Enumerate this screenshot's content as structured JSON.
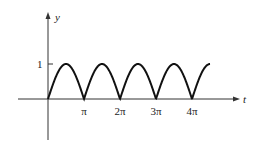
{
  "chart_data": {
    "type": "line",
    "title": "",
    "function": "y = |sin t|",
    "xlabel": "t",
    "ylabel": "y",
    "x_ticks": [
      {
        "value": 3.14159,
        "label": "π"
      },
      {
        "value": 6.28319,
        "label": "2π"
      },
      {
        "value": 9.42478,
        "label": "3π"
      },
      {
        "value": 12.56637,
        "label": "4π"
      }
    ],
    "y_ticks": [
      {
        "value": 1,
        "label": "1"
      }
    ],
    "x_range": [
      0,
      14.14
    ],
    "y_range": [
      0,
      1
    ],
    "grid": false,
    "legend": null,
    "series": [
      {
        "name": "|sin t|",
        "x_start": 0,
        "x_end": 14.14,
        "peaks": [
          1.5708,
          4.7124,
          7.854,
          10.9956
        ],
        "zeros": [
          0,
          3.14159,
          6.28319,
          9.42478,
          12.56637
        ]
      }
    ]
  },
  "labels": {
    "y_axis": "y",
    "t_axis": "t",
    "y_tick_1": "1",
    "x_tick_pi": "π",
    "x_tick_2pi": "2π",
    "x_tick_3pi": "3π",
    "x_tick_4pi": "4π"
  }
}
